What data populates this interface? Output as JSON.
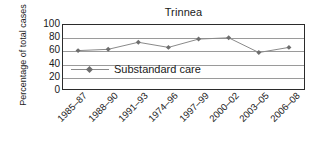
{
  "chart_data": {
    "type": "line",
    "title": "Trinnea",
    "xlabel": "",
    "ylabel": "Percentage of total cases",
    "categories": [
      "1985–87",
      "1988–90",
      "1991–93",
      "1974–96",
      "1997–99",
      "2000–02",
      "2003–05",
      "2006–08"
    ],
    "series": [
      {
        "name": "Substandard care",
        "values": [
          60,
          62,
          73,
          65,
          78,
          80,
          57,
          65
        ],
        "color": "#8a8a8a",
        "marker": "diamond",
        "marker_color": "#6e6e6e"
      }
    ],
    "ylim": [
      0,
      100
    ],
    "yticks": [
      0,
      20,
      40,
      60,
      80,
      100
    ],
    "ytick_labels": [
      "0",
      "20",
      "40",
      "60",
      "80",
      "100"
    ],
    "gridlines": [
      20,
      40,
      60,
      80
    ],
    "grid": true,
    "grid_color": "#9a9a9a",
    "frame_color": "#2b2b2b",
    "legend_position": "inside-left-middle"
  },
  "legend": {
    "entries": [
      {
        "label": "Substandard care"
      }
    ]
  }
}
